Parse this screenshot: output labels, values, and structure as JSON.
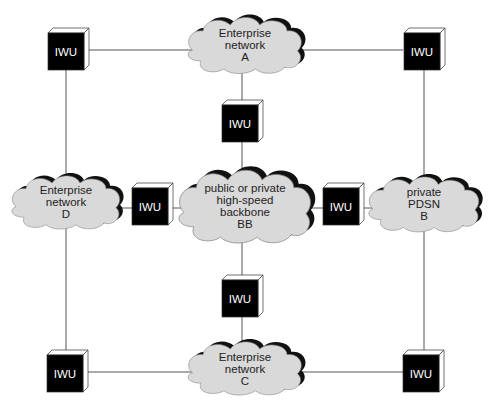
{
  "diagram": {
    "colors": {
      "line": "#555555",
      "cloud_fill": "#d9d9d9",
      "cloud_shadow": "#111111",
      "iwu_fill": "#000000",
      "iwu_text": "#ffffff"
    },
    "nodes": {
      "iwu_top_left": {
        "label": "IWU"
      },
      "iwu_top_right": {
        "label": "IWU"
      },
      "iwu_center_top": {
        "label": "IWU"
      },
      "iwu_left_mid": {
        "label": "IWU"
      },
      "iwu_right_mid": {
        "label": "IWU"
      },
      "iwu_center_bottom": {
        "label": "IWU"
      },
      "iwu_bottom_left": {
        "label": "IWU"
      },
      "iwu_bottom_right": {
        "label": "IWU"
      },
      "cloud_a": {
        "lines": [
          "Enterprise",
          "network",
          "A"
        ]
      },
      "cloud_d": {
        "lines": [
          "Enterprise",
          "network",
          "D"
        ]
      },
      "cloud_bb": {
        "lines": [
          "public or private",
          "high-speed",
          "backbone",
          "BB"
        ]
      },
      "cloud_b": {
        "lines": [
          "private",
          "PDSN",
          "B"
        ]
      },
      "cloud_c": {
        "lines": [
          "Enterprise",
          "network",
          "C"
        ]
      }
    }
  }
}
